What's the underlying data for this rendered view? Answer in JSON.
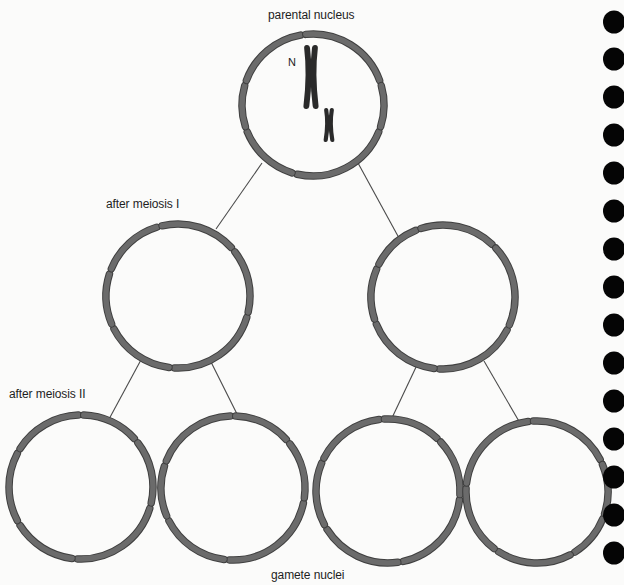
{
  "labels": {
    "parental": "parental nucleus",
    "meiosis1": "after meiosis I",
    "meiosis2": "after meiosis II",
    "gametes": "gamete nuclei",
    "chromosome_marker": "N"
  },
  "colors": {
    "background": "#fbfbfa",
    "membrane_fill": "#6b6b6b",
    "membrane_stroke": "#3f3f3f",
    "chromosome": "#2a2a2a",
    "line": "#4a4a4a",
    "binding_hole": "#050505",
    "text": "#1e1e1e"
  },
  "nuclei": [
    {
      "id": "parental",
      "cx": 313,
      "cy": 105,
      "r": 71,
      "gaps": [
        105,
        160,
        198,
        262,
        342,
        20
      ]
    },
    {
      "id": "m1-left",
      "cx": 178,
      "cy": 296,
      "r": 72,
      "gaps": [
        95,
        155,
        200,
        255,
        320,
        15
      ]
    },
    {
      "id": "m1-right",
      "cx": 443,
      "cy": 297,
      "r": 72,
      "gaps": [
        95,
        160,
        205,
        250,
        315,
        25
      ]
    },
    {
      "id": "gamete-1",
      "cx": 81,
      "cy": 487,
      "r": 72,
      "gaps": [
        95,
        150,
        210,
        270,
        320,
        15
      ]
    },
    {
      "id": "gamete-2",
      "cx": 233,
      "cy": 488,
      "r": 72,
      "gaps": [
        95,
        155,
        200,
        270,
        320,
        10
      ]
    },
    {
      "id": "gamete-3",
      "cx": 388,
      "cy": 491,
      "r": 72,
      "gaps": [
        80,
        150,
        205,
        265,
        315,
        5
      ]
    },
    {
      "id": "gamete-4",
      "cx": 537,
      "cy": 492,
      "r": 71,
      "gaps": [
        60,
        125,
        185,
        265,
        335,
        20
      ]
    }
  ],
  "connectors": [
    {
      "from": "parental",
      "to": "m1-left",
      "x1": 262,
      "y1": 163,
      "x2": 216,
      "y2": 229
    },
    {
      "from": "parental",
      "to": "m1-right",
      "x1": 358,
      "y1": 163,
      "x2": 399,
      "y2": 238
    },
    {
      "from": "m1-left",
      "to": "gamete-1",
      "x1": 142,
      "y1": 358,
      "x2": 108,
      "y2": 421
    },
    {
      "from": "m1-left",
      "to": "gamete-2",
      "x1": 211,
      "y1": 362,
      "x2": 238,
      "y2": 416
    },
    {
      "from": "m1-right",
      "to": "gamete-3",
      "x1": 417,
      "y1": 365,
      "x2": 391,
      "y2": 420
    },
    {
      "from": "m1-right",
      "to": "gamete-4",
      "x1": 484,
      "y1": 361,
      "x2": 520,
      "y2": 423
    }
  ],
  "chromosomes": [
    {
      "id": "large",
      "cx": 311,
      "cy": 77,
      "h": 58,
      "w": 14
    },
    {
      "id": "small",
      "cx": 329,
      "cy": 125,
      "h": 30,
      "w": 10
    }
  ],
  "binding_holes": {
    "x": 614,
    "r": 11,
    "y": [
      22,
      59,
      97,
      135,
      173,
      211,
      249,
      287,
      325,
      363,
      401,
      439,
      477,
      515,
      553
    ]
  }
}
